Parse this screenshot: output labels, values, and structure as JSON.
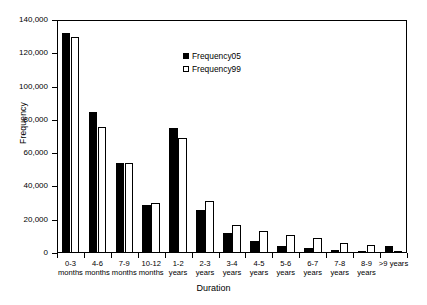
{
  "chart_data": {
    "type": "bar",
    "title": "",
    "xlabel": "Duration",
    "ylabel": "Frequency",
    "ylim": [
      0,
      140000
    ],
    "ytick_values": [
      0,
      20000,
      40000,
      60000,
      80000,
      100000,
      120000,
      140000
    ],
    "ytick_labels": [
      "0",
      "20,000",
      "40,000",
      "60,000",
      "80,000",
      "100,000",
      "120,000",
      "140,000"
    ],
    "grid": false,
    "legend_position": "upper-center",
    "categories": [
      "0-3\nmonths",
      "4-6\nmonths",
      "7-9\nmonths",
      "10-12\nmonths",
      "1-2\nyears",
      "2-3\nyears",
      "3-4\nyears",
      "4-5\nyears",
      "5-6\nyears",
      "6-7\nyears",
      "7-8\nyears",
      "8-9\nyears",
      ">9 years"
    ],
    "series": [
      {
        "name": "Frequency05",
        "color": "#000000",
        "fill": "solid",
        "values": [
          132000,
          85000,
          54000,
          29000,
          75000,
          26000,
          12000,
          7000,
          4000,
          3000,
          2000,
          1500,
          4000
        ]
      },
      {
        "name": "Frequency99",
        "color": "#ffffff",
        "fill": "outline",
        "values": [
          130000,
          76000,
          54000,
          30000,
          69000,
          31000,
          17000,
          13000,
          11000,
          9000,
          6000,
          5000,
          1000
        ]
      }
    ]
  },
  "legend": {
    "items": [
      {
        "label": "Frequency05",
        "style": "s05"
      },
      {
        "label": "Frequency99",
        "style": "s99"
      }
    ]
  }
}
